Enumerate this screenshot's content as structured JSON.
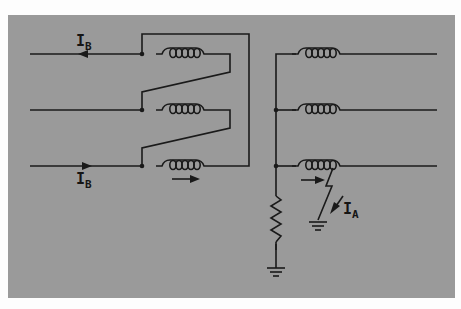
{
  "figure": {
    "title": "",
    "colors": {
      "background": "#fdfdfd",
      "panel": "#9a9a9a",
      "lines": "#1a1a1a"
    }
  },
  "labels": {
    "ib_top": {
      "main": "I",
      "sub": "B"
    },
    "ib_bottom": {
      "main": "I",
      "sub": "B"
    },
    "ia_fault": {
      "main": "I",
      "sub": "A"
    }
  },
  "components": {
    "primary": {
      "connection": "delta",
      "windings": 3
    },
    "secondary": {
      "connection": "wye",
      "windings": 3
    },
    "neutral_grounding": "resistor",
    "fault": "phase-to-ground"
  }
}
